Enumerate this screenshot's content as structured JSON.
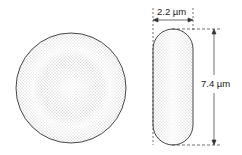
{
  "diagram": {
    "views": {
      "face": {
        "name": "top view"
      },
      "side": {
        "name": "side view"
      }
    },
    "dimensions": {
      "thickness_label": "2.2 µm",
      "diameter_label": "7.4 µm"
    },
    "colors": {
      "outline": "#333333",
      "stipple": "#555555",
      "background": "#ffffff"
    }
  }
}
